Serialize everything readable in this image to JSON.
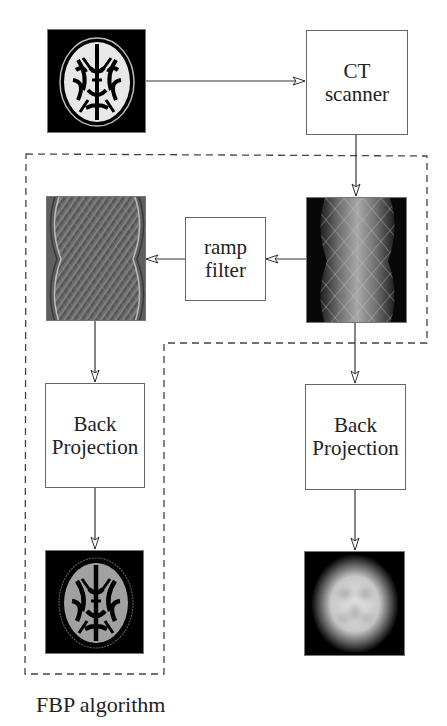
{
  "diagram": {
    "nodes": {
      "phantom": {
        "label": "",
        "kind": "image",
        "description": "axial brain slice (original)"
      },
      "ct_scanner": {
        "label_line1": "CT",
        "label_line2": "scanner"
      },
      "sinogram": {
        "label": "",
        "kind": "image",
        "description": "sinogram"
      },
      "ramp_filter": {
        "label_line1": "ramp",
        "label_line2": "filter"
      },
      "filtered_sinogram": {
        "label": "",
        "kind": "image",
        "description": "ramp-filtered sinogram"
      },
      "bp_fbp": {
        "label_line1": "Back",
        "label_line2": "Projection"
      },
      "bp_plain": {
        "label_line1": "Back",
        "label_line2": "Projection"
      },
      "fbp_result": {
        "label": "",
        "kind": "image",
        "description": "sharp reconstructed brain slice"
      },
      "bp_result": {
        "label": "",
        "kind": "image",
        "description": "blurry reconstructed image"
      }
    },
    "edges": [
      {
        "from": "phantom",
        "to": "ct_scanner"
      },
      {
        "from": "ct_scanner",
        "to": "sinogram"
      },
      {
        "from": "sinogram",
        "to": "ramp_filter"
      },
      {
        "from": "ramp_filter",
        "to": "filtered_sinogram"
      },
      {
        "from": "filtered_sinogram",
        "to": "bp_fbp"
      },
      {
        "from": "bp_fbp",
        "to": "fbp_result"
      },
      {
        "from": "sinogram",
        "to": "bp_plain"
      },
      {
        "from": "bp_plain",
        "to": "bp_result"
      }
    ],
    "group": {
      "label": "FBP algorithm",
      "style": "dashed"
    },
    "colors": {
      "line": "#333333",
      "box_border": "#666666",
      "dash": "#444444",
      "background": "#ffffff"
    }
  }
}
